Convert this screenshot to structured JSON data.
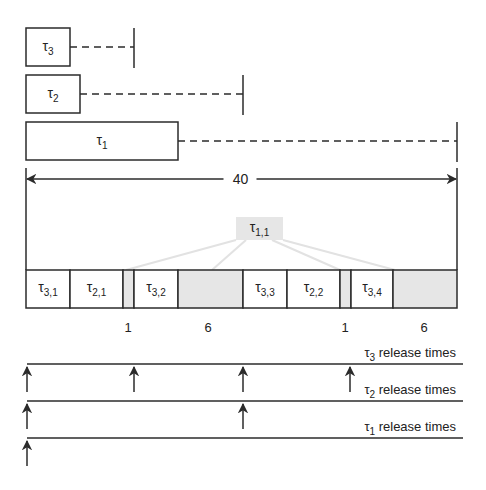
{
  "colors": {
    "line": "#2b2b2b",
    "idle_fill": "#e6e6e6",
    "connector": "#e2e2e2",
    "background": "#ffffff"
  },
  "periods": [
    {
      "task": "τ",
      "sub": "3",
      "exec_x": [
        26,
        70
      ],
      "deadline_x": 134,
      "y": [
        28,
        66
      ]
    },
    {
      "task": "τ",
      "sub": "2",
      "exec_x": [
        26,
        80
      ],
      "deadline_x": 243,
      "y": [
        75,
        113
      ]
    },
    {
      "task": "τ",
      "sub": "1",
      "exec_x": [
        26,
        178
      ],
      "deadline_x": 457,
      "y": [
        122,
        160
      ]
    }
  ],
  "hyperperiod": {
    "label": "40",
    "x": [
      26,
      457
    ],
    "y": 179
  },
  "timeline": {
    "y": [
      270,
      308
    ],
    "segments": [
      {
        "type": "job",
        "task": "τ",
        "sub": "3,1",
        "x": [
          26,
          70
        ]
      },
      {
        "type": "job",
        "task": "τ",
        "sub": "2,1",
        "x": [
          70,
          123
        ]
      },
      {
        "type": "idle",
        "task": "",
        "sub": "",
        "x": [
          123,
          134
        ]
      },
      {
        "type": "job",
        "task": "τ",
        "sub": "3,2",
        "x": [
          134,
          178
        ]
      },
      {
        "type": "idle",
        "task": "",
        "sub": "",
        "x": [
          178,
          243
        ]
      },
      {
        "type": "job",
        "task": "τ",
        "sub": "3,3",
        "x": [
          243,
          287
        ]
      },
      {
        "type": "job",
        "task": "τ",
        "sub": "2,2",
        "x": [
          287,
          340
        ]
      },
      {
        "type": "idle",
        "task": "",
        "sub": "",
        "x": [
          340,
          351
        ]
      },
      {
        "type": "job",
        "task": "τ",
        "sub": "3,4",
        "x": [
          351,
          393
        ]
      },
      {
        "type": "idle",
        "task": "",
        "sub": "",
        "x": [
          393,
          457
        ]
      }
    ],
    "gap_labels": [
      {
        "text": "1",
        "x": 128
      },
      {
        "text": "6",
        "x": 208
      },
      {
        "text": "1",
        "x": 345
      },
      {
        "text": "6",
        "x": 424
      }
    ],
    "gap_label_y": 332
  },
  "split_job": {
    "task": "τ",
    "sub": "1,1",
    "box": [
      236,
      217,
      283,
      240
    ],
    "connectors": [
      [
        236,
        240,
        126,
        270
      ],
      [
        246,
        240,
        212,
        270
      ],
      [
        272,
        240,
        340,
        270
      ],
      [
        283,
        240,
        395,
        270
      ]
    ]
  },
  "release_rows": [
    {
      "task": "τ",
      "sub": "3",
      "label": " release times",
      "line_y": 364,
      "arrows_x": [
        27,
        134,
        243,
        350
      ]
    },
    {
      "task": "τ",
      "sub": "2",
      "label": " release times",
      "line_y": 401,
      "arrows_x": [
        27,
        243
      ]
    },
    {
      "task": "τ",
      "sub": "1",
      "label": " release times",
      "line_y": 438,
      "arrows_x": [
        27
      ]
    }
  ],
  "release_line_x": [
    27,
    463
  ],
  "release_label_right_x": 456
}
